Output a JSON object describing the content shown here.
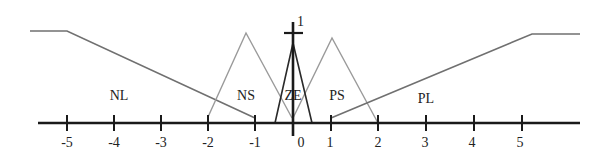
{
  "diagram": {
    "y_max_label": "1",
    "x_ticks": [
      {
        "label": "-5",
        "x": 67
      },
      {
        "label": "-4",
        "x": 114
      },
      {
        "label": "-3",
        "x": 161
      },
      {
        "label": "-2",
        "x": 208
      },
      {
        "label": "-1",
        "x": 255
      },
      {
        "label": "0",
        "x": 297
      },
      {
        "label": "1",
        "x": 331
      },
      {
        "label": "2",
        "x": 378
      },
      {
        "label": "3",
        "x": 426
      },
      {
        "label": "4",
        "x": 474
      },
      {
        "label": "5",
        "x": 522
      }
    ],
    "sets": {
      "NL": "NL",
      "NS": "NS",
      "ZE": "ZE",
      "PS": "PS",
      "PL": "PL"
    },
    "colors": {
      "axis": "#1a1a1a",
      "outer_sets": "#6e6e6e",
      "small_sets": "#9a9a9a",
      "zero_set": "#2a2a2a"
    }
  }
}
